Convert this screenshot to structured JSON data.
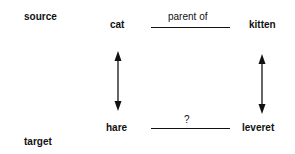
{
  "roles": {
    "source": "source",
    "target": "target"
  },
  "terms": {
    "source_a": "cat",
    "source_b": "kitten",
    "target_a": "hare",
    "target_b": "leveret"
  },
  "relations": {
    "source_relation": "parent of",
    "target_relation": "?"
  }
}
